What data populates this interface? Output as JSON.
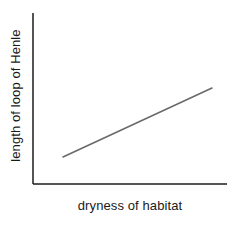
{
  "chart_data": {
    "type": "line",
    "title": "",
    "subtitle": "",
    "xlabel": "dryness of habitat",
    "ylabel": "length of loop of Henle",
    "grid": false,
    "legend": null,
    "legend_position": "none",
    "tick_labels_x": [],
    "tick_labels_y": [],
    "xlim": [
      0,
      1
    ],
    "ylim": [
      0,
      1
    ],
    "annotations": [],
    "series": [
      {
        "name": "trend",
        "style": "straight-line",
        "color": "#6a6a6a",
        "line_width": 1.6,
        "x": [
          0.155,
          0.923
        ],
        "y": [
          0.158,
          0.561
        ],
        "points_px": [
          {
            "x": 63,
            "y": 157
          },
          {
            "x": 212,
            "y": 88
          }
        ]
      }
    ],
    "axes": {
      "color": "#1c1c1c",
      "line_width": 1.5,
      "origin_px": {
        "x": 33,
        "y": 184
      },
      "y_axis_top_px": 13,
      "x_axis_right_px": 227,
      "ticks": "none"
    },
    "background_color": "#ffffff"
  }
}
